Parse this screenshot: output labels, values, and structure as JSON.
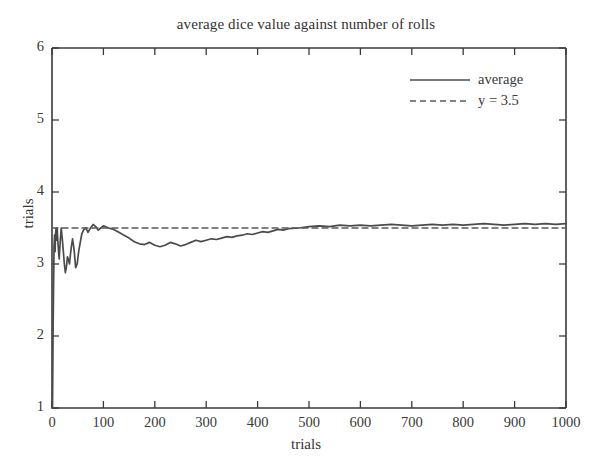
{
  "chart_data": {
    "type": "line",
    "title": "average dice value against number of rolls",
    "xlabel": "trials",
    "ylabel": "trials",
    "xlim": [
      0,
      1000
    ],
    "ylim": [
      1,
      6
    ],
    "grid": false,
    "legend_position": "upper right",
    "xticks": [
      0,
      100,
      200,
      300,
      400,
      500,
      600,
      700,
      800,
      900,
      1000
    ],
    "xtick_labels": [
      "0",
      "100",
      "200",
      "300",
      "400",
      "500",
      "600",
      "700",
      "800",
      "900",
      "1000"
    ],
    "yticks": [
      1,
      2,
      3,
      4,
      5,
      6
    ],
    "ytick_labels": [
      "1",
      "2",
      "3",
      "4",
      "5",
      "6"
    ],
    "series": [
      {
        "name": "average",
        "style": "solid",
        "color": "#4a4a4a",
        "x": [
          1,
          2,
          3,
          4,
          5,
          6,
          7,
          8,
          9,
          10,
          11,
          12,
          13,
          14,
          15,
          16,
          17,
          18,
          19,
          20,
          22,
          24,
          26,
          28,
          30,
          32,
          34,
          36,
          38,
          40,
          43,
          46,
          49,
          52,
          55,
          58,
          62,
          66,
          70,
          75,
          80,
          85,
          90,
          95,
          100,
          110,
          120,
          130,
          140,
          150,
          160,
          170,
          180,
          190,
          200,
          210,
          220,
          230,
          240,
          250,
          260,
          270,
          280,
          290,
          300,
          310,
          320,
          330,
          340,
          350,
          360,
          370,
          380,
          390,
          400,
          410,
          420,
          430,
          440,
          450,
          460,
          480,
          500,
          520,
          540,
          560,
          580,
          600,
          620,
          640,
          660,
          680,
          700,
          720,
          740,
          760,
          780,
          800,
          820,
          840,
          860,
          880,
          900,
          920,
          940,
          960,
          980,
          1000
        ],
        "y": [
          1.0,
          2.0,
          2.67,
          3.25,
          3.4,
          3.17,
          3.43,
          3.5,
          3.33,
          3.5,
          3.36,
          3.25,
          3.15,
          3.07,
          3.2,
          3.31,
          3.41,
          3.5,
          3.42,
          3.35,
          3.18,
          3.0,
          2.88,
          2.96,
          3.1,
          3.06,
          3.0,
          3.14,
          3.26,
          3.35,
          3.2,
          2.95,
          3.0,
          3.18,
          3.3,
          3.42,
          3.48,
          3.5,
          3.44,
          3.5,
          3.55,
          3.52,
          3.47,
          3.5,
          3.53,
          3.5,
          3.48,
          3.44,
          3.4,
          3.36,
          3.31,
          3.28,
          3.27,
          3.3,
          3.26,
          3.24,
          3.26,
          3.3,
          3.28,
          3.25,
          3.27,
          3.3,
          3.33,
          3.31,
          3.33,
          3.35,
          3.34,
          3.36,
          3.38,
          3.37,
          3.39,
          3.4,
          3.42,
          3.41,
          3.43,
          3.45,
          3.44,
          3.46,
          3.48,
          3.47,
          3.49,
          3.5,
          3.52,
          3.53,
          3.52,
          3.54,
          3.53,
          3.54,
          3.53,
          3.54,
          3.55,
          3.54,
          3.53,
          3.54,
          3.55,
          3.54,
          3.55,
          3.54,
          3.55,
          3.56,
          3.55,
          3.54,
          3.55,
          3.56,
          3.55,
          3.56,
          3.55,
          3.56
        ]
      },
      {
        "name": "y = 3.5",
        "style": "dashed",
        "color": "#5a5a5a",
        "x": [
          0,
          1000
        ],
        "y": [
          3.5,
          3.5
        ]
      }
    ]
  },
  "legend": {
    "entries": [
      {
        "label": "average",
        "style": "solid"
      },
      {
        "label": "y = 3.5",
        "style": "dashed"
      }
    ]
  },
  "colors": {
    "axis": "#3a3a3a",
    "series_average": "#4a4a4a",
    "series_reference": "#5a5a5a",
    "background": "#ffffff"
  }
}
